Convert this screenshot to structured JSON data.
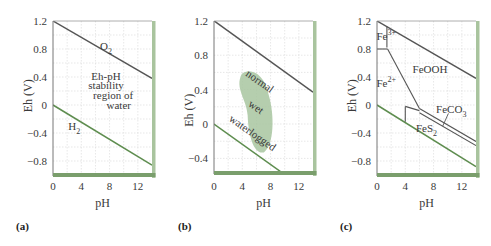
{
  "figure": {
    "panels": [
      {
        "id": "a",
        "label": "(a)",
        "xlabel": "pH",
        "ylabel": "Eh (V)"
      },
      {
        "id": "b",
        "label": "(b)",
        "xlabel": "pH",
        "ylabel": "Eh (V)"
      },
      {
        "id": "c",
        "label": "(c)",
        "xlabel": "pH",
        "ylabel": "Eh (V)"
      }
    ],
    "colors": {
      "o2_line": "#555555",
      "h2_line": "#5e8d4f",
      "bottom_bar": "#7a9e6c",
      "right_bar": "#a9c49e",
      "grid": "#dcdcdc",
      "blob": "#a8c6a0",
      "fe_lines": "#555555"
    }
  },
  "chart_data": [
    {
      "type": "line",
      "panel": "(a)",
      "title": "",
      "xlabel": "pH",
      "ylabel": "Eh (V)",
      "xlim": [
        0,
        14
      ],
      "ylim": [
        -1.0,
        1.2
      ],
      "xticks": [
        "0",
        "4",
        "8",
        "12"
      ],
      "yticks": [
        "1.2",
        "0.8",
        "0.4",
        "0",
        "−0.4",
        "−0.8"
      ],
      "grid": true,
      "series": [
        {
          "name": "O2",
          "x": [
            0,
            14
          ],
          "y": [
            1.2,
            0.38
          ]
        },
        {
          "name": "H2",
          "x": [
            0,
            14
          ],
          "y": [
            0.0,
            -0.86
          ]
        }
      ],
      "annotations": [
        {
          "text": "O2",
          "x": 7.5,
          "y": 0.84
        },
        {
          "text": "Eh-pH",
          "x": 7.5,
          "y": 0.42
        },
        {
          "text": "stability",
          "x": 7.5,
          "y": 0.28
        },
        {
          "text": "region of",
          "x": 8.5,
          "y": 0.14
        },
        {
          "text": "water",
          "x": 9.3,
          "y": 0.0
        },
        {
          "text": "H2",
          "x": 3.0,
          "y": -0.3
        }
      ]
    },
    {
      "type": "line",
      "panel": "(b)",
      "title": "",
      "xlabel": "pH",
      "ylabel": "Eh (V)",
      "xlim": [
        0,
        14
      ],
      "ylim": [
        -0.6,
        1.2
      ],
      "xticks": [
        "0",
        "4",
        "8",
        "12"
      ],
      "yticks": [
        "1.2",
        "0.8",
        "0.4",
        "0",
        "−0.4"
      ],
      "grid": true,
      "series": [
        {
          "name": "O2",
          "x": [
            0,
            14
          ],
          "y": [
            1.2,
            0.37
          ]
        },
        {
          "name": "H2",
          "x": [
            0,
            10.2
          ],
          "y": [
            0.0,
            -0.6
          ]
        }
      ],
      "regions": [
        {
          "name": "soil moisture envelope",
          "shape": "blob",
          "x_range": [
            3.3,
            8.5
          ],
          "y_range": [
            -0.33,
            0.63
          ]
        }
      ],
      "annotations": [
        {
          "text": "normal",
          "x": 6.5,
          "y": 0.5
        },
        {
          "text": "wet",
          "x": 6.0,
          "y": 0.2
        },
        {
          "text": "waterlogged",
          "x": 5.5,
          "y": -0.1
        }
      ]
    },
    {
      "type": "line",
      "panel": "(c)",
      "title": "",
      "xlabel": "pH",
      "ylabel": "Eh (V)",
      "xlim": [
        0,
        14
      ],
      "ylim": [
        -1.0,
        1.2
      ],
      "xticks": [
        "0",
        "4",
        "8",
        "12"
      ],
      "yticks": [
        "1.2",
        "0.8",
        "0.4",
        "0",
        "−0.4",
        "−0.8"
      ],
      "grid": true,
      "series": [
        {
          "name": "O2",
          "x": [
            0,
            14
          ],
          "y": [
            1.2,
            0.38
          ]
        },
        {
          "name": "H2",
          "x": [
            0,
            14
          ],
          "y": [
            0.0,
            -0.88
          ]
        },
        {
          "name": "Fe3+/Fe2+ vertical",
          "x": [
            1.4,
            1.4
          ],
          "y": [
            1.12,
            0.82
          ]
        },
        {
          "name": "Fe3+/Fe2+ horizontal",
          "x": [
            0,
            1.5
          ],
          "y": [
            0.8,
            0.8
          ]
        },
        {
          "name": "Fe2+/FeOOH",
          "x": [
            1.5,
            6.0
          ],
          "y": [
            0.8,
            -0.05
          ]
        },
        {
          "name": "FeOOH/FeCO3",
          "x": [
            6.0,
            14
          ],
          "y": [
            -0.05,
            -0.52
          ]
        },
        {
          "name": "FeCO3/FeS2",
          "x": [
            6.0,
            14
          ],
          "y": [
            -0.11,
            -0.58
          ]
        },
        {
          "name": "Fe2+/FeS2 top",
          "x": [
            4.0,
            6.0
          ],
          "y": [
            -0.02,
            -0.08
          ]
        },
        {
          "name": "Fe2+/FeS2 vertical",
          "x": [
            4.0,
            4.0
          ],
          "y": [
            -0.24,
            -0.02
          ]
        }
      ],
      "annotations": [
        {
          "text": "Fe3+",
          "x": 1.3,
          "y": 0.98
        },
        {
          "text": "FeOOH",
          "x": 7.5,
          "y": 0.52
        },
        {
          "text": "Fe2+",
          "x": 1.3,
          "y": 0.32
        },
        {
          "text": "FeCO3",
          "x": 10.5,
          "y": -0.05
        },
        {
          "text": "FeS2",
          "x": 7.0,
          "y": -0.33
        }
      ]
    }
  ]
}
